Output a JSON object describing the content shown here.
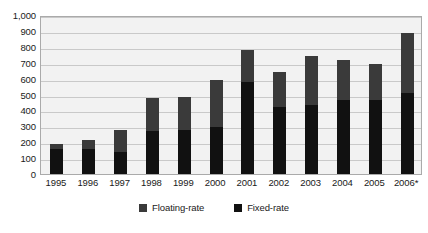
{
  "chart_data": {
    "type": "bar",
    "stacked": true,
    "title": "",
    "subtitle": "",
    "xlabel": "",
    "ylabel": "",
    "ylim": [
      0,
      1000
    ],
    "ytick_step": 100,
    "ytick_labels": [
      "1,000",
      "900",
      "800",
      "700",
      "600",
      "500",
      "400",
      "300",
      "200",
      "100",
      "0"
    ],
    "ytick_values": [
      1000,
      900,
      800,
      700,
      600,
      500,
      400,
      300,
      200,
      100,
      0
    ],
    "grid": true,
    "grid_axis": "y",
    "legend_position": "bottom",
    "categories": [
      "1995",
      "1996",
      "1997",
      "1998",
      "1999",
      "2000",
      "2001",
      "2002",
      "2003",
      "2004",
      "2005",
      "2006*"
    ],
    "series": [
      {
        "name": "Fixed-rate",
        "color": "#111111",
        "values": [
          155,
          155,
          140,
          270,
          275,
          295,
          580,
          420,
          435,
          465,
          465,
          510
        ]
      },
      {
        "name": "Floating-rate",
        "color": "#3a3a3a",
        "values": [
          35,
          60,
          140,
          205,
          210,
          295,
          200,
          220,
          305,
          255,
          230,
          375
        ]
      }
    ],
    "totals": [
      190,
      215,
      280,
      475,
      485,
      590,
      780,
      640,
      740,
      720,
      695,
      885
    ],
    "annotations": [
      "2006 figure marked with asterisk"
    ]
  },
  "legend": {
    "items": [
      {
        "label": "Floating-rate",
        "color": "#3a3a3a"
      },
      {
        "label": "Fixed-rate",
        "color": "#111111"
      }
    ]
  },
  "colors": {
    "plot_background": "#f2f2f2",
    "plot_border": "#aaaaaa",
    "gridline": "#c9c9c9",
    "text": "#1a1a1a",
    "page_background": "#ffffff"
  }
}
